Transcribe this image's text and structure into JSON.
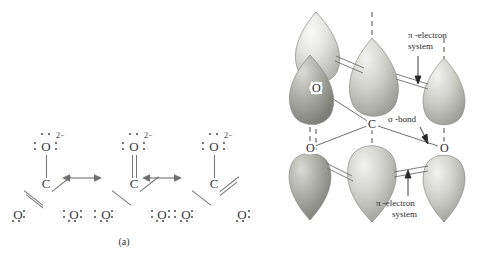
{
  "figure": {
    "background_color": "#ffffff",
    "ink_color": "#3a3a3a"
  },
  "panel_a": {
    "caption": "(a)",
    "structure_count": 3,
    "resonance_arrow_symbol": "double-headed",
    "structures": [
      {
        "id": "resonance-structure-1",
        "charge": "2−",
        "central_atom": "C",
        "top_oxygen": "O",
        "bottom_left_oxygen": "O",
        "bottom_right_oxygen": "O",
        "bonds": {
          "top": "single",
          "bottom_left": "double",
          "bottom_right": "single"
        }
      },
      {
        "id": "resonance-structure-2",
        "charge": "2−",
        "central_atom": "C",
        "top_oxygen": "O",
        "bottom_left_oxygen": "O",
        "bottom_right_oxygen": "O",
        "bonds": {
          "top": "double",
          "bottom_left": "single",
          "bottom_right": "single"
        }
      },
      {
        "id": "resonance-structure-3",
        "charge": "2−",
        "central_atom": "C",
        "top_oxygen": "O",
        "bottom_left_oxygen": "O",
        "bottom_right_oxygen": "O",
        "bonds": {
          "top": "single",
          "bottom_left": "single",
          "bottom_right": "double"
        }
      }
    ]
  },
  "panel_b": {
    "caption": "(b)",
    "central_atom_label": "C",
    "oxygen_labels": [
      "O",
      "O",
      "O"
    ],
    "annotations": {
      "pi_top_line1": "π -electron",
      "pi_top_line2": "system",
      "pi_bottom_line1": "π -electron",
      "pi_bottom_line2": "system",
      "sigma_bond": "σ -bond"
    },
    "orbital_lobe_count": 6,
    "orbital_shape": "teardrop",
    "axis_style": "dashed-vertical",
    "colors": {
      "lobe_light": "#e8e8e6",
      "lobe_mid": "#bdbdb9",
      "lobe_dark": "#8a8a86",
      "axis": "#4a4a4a",
      "bond_line": "#6f6f6f"
    }
  }
}
